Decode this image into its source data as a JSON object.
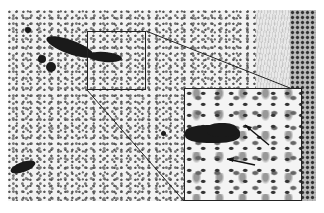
{
  "image": {
    "description": "Grayscale histology micrograph with a rectangular region of interest magnified in an inset",
    "regions": {
      "main_field": {
        "x": 8,
        "y": 10,
        "width": 308,
        "height": 191
      },
      "roi_box": {
        "x": 87,
        "y": 31,
        "width": 59,
        "height": 59
      },
      "inset_box": {
        "x": 184,
        "y": 88,
        "width": 118,
        "height": 113
      }
    },
    "annotations": [
      {
        "type": "arrow",
        "location": "inset",
        "target": "cell upper-right of dark stained cluster"
      },
      {
        "type": "arrow",
        "location": "inset",
        "target": "cell lower-left below dark stained cluster"
      }
    ],
    "colors": {
      "background": "#ffffff",
      "stain_dark": "#1a1a1a",
      "tissue": "#f2f2f2",
      "box_border": "#222222"
    }
  }
}
